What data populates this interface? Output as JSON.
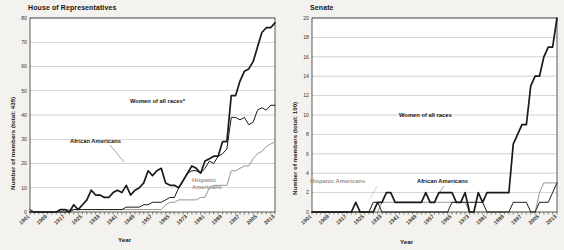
{
  "background": "#f4f2ee",
  "colors": {
    "women": "#1a1a1a",
    "african_americans": "#1a1a1a",
    "hispanic_americans": "#9a948a",
    "grid": "#8b857b",
    "axis": "#17140f",
    "text": "#17140f"
  },
  "chart_data": [
    {
      "type": "line",
      "title": "House of Representatives",
      "xlabel": "Year",
      "ylabel": "Number of members (total: 435)",
      "ylim": [
        0,
        80
      ],
      "ytick_step": 10,
      "yticks": [
        0,
        10,
        20,
        30,
        40,
        50,
        60,
        70,
        80
      ],
      "xlim": [
        1901,
        2013
      ],
      "xticks": [
        1901,
        1909,
        1917,
        1925,
        1933,
        1941,
        1949,
        1957,
        1965,
        1973,
        1981,
        1989,
        1997,
        2005,
        2013
      ],
      "xtick_labels": [
        "1901",
        "1909",
        "1917",
        "1925",
        "1933",
        "1941",
        "1949",
        "1957",
        "1965",
        "1973",
        "1981",
        "1989",
        "1997",
        "2005",
        "2013"
      ],
      "grid": true,
      "legend_position": "inline-annotations",
      "annotations": [
        {
          "text": "Women of all races*",
          "series": "women"
        },
        {
          "text": "African Americans",
          "series": "african_americans"
        },
        {
          "text": "Hispanic Americans",
          "series": "hispanic_americans"
        }
      ],
      "x": [
        1901,
        1903,
        1905,
        1907,
        1909,
        1911,
        1913,
        1915,
        1917,
        1919,
        1921,
        1923,
        1925,
        1927,
        1929,
        1931,
        1933,
        1935,
        1937,
        1939,
        1941,
        1943,
        1945,
        1947,
        1949,
        1951,
        1953,
        1955,
        1957,
        1959,
        1961,
        1963,
        1965,
        1967,
        1969,
        1971,
        1973,
        1975,
        1977,
        1979,
        1981,
        1983,
        1985,
        1987,
        1989,
        1991,
        1993,
        1995,
        1997,
        1999,
        2001,
        2003,
        2005,
        2007,
        2009,
        2011,
        2013
      ],
      "series": [
        {
          "name": "Women of all races*",
          "values": [
            0,
            0,
            0,
            0,
            0,
            0,
            0,
            1,
            1,
            0,
            3,
            1,
            3,
            5,
            9,
            7,
            7,
            6,
            6,
            8,
            9,
            8,
            11,
            7,
            9,
            10,
            12,
            17,
            15,
            17,
            18,
            12,
            11,
            11,
            10,
            13,
            16,
            19,
            18,
            16,
            21,
            22,
            23,
            23,
            29,
            29,
            48,
            48,
            54,
            58,
            59,
            62,
            68,
            74,
            76,
            76,
            78
          ]
        },
        {
          "name": "African Americans",
          "values": [
            1,
            0,
            0,
            0,
            0,
            0,
            0,
            0,
            0,
            0,
            1,
            1,
            1,
            1,
            1,
            1,
            1,
            1,
            1,
            1,
            1,
            1,
            2,
            2,
            2,
            2,
            3,
            3,
            4,
            4,
            4,
            5,
            6,
            6,
            10,
            13,
            16,
            17,
            17,
            16,
            18,
            21,
            20,
            23,
            24,
            26,
            39,
            39,
            38,
            39,
            36,
            37,
            42,
            43,
            42,
            44,
            44
          ]
        },
        {
          "name": "Hispanic Americans",
          "values": [
            0,
            0,
            0,
            0,
            0,
            0,
            0,
            0,
            1,
            1,
            1,
            1,
            1,
            1,
            1,
            1,
            1,
            1,
            1,
            1,
            1,
            1,
            1,
            1,
            1,
            1,
            1,
            1,
            1,
            1,
            1,
            3,
            4,
            4,
            5,
            5,
            5,
            5,
            5,
            6,
            6,
            10,
            11,
            11,
            11,
            11,
            17,
            17,
            18,
            19,
            19,
            22,
            24,
            25,
            27,
            28,
            29
          ]
        }
      ]
    },
    {
      "type": "line",
      "title": "Senate",
      "xlabel": "Year",
      "ylabel": "Number of members (total: 100)",
      "ylim": [
        0,
        20
      ],
      "ytick_step": 2,
      "yticks": [
        0,
        2,
        4,
        6,
        8,
        10,
        12,
        14,
        16,
        18,
        20
      ],
      "xlim": [
        1901,
        2013
      ],
      "xticks": [
        1901,
        1909,
        1917,
        1925,
        1933,
        1941,
        1949,
        1957,
        1965,
        1973,
        1981,
        1989,
        1997,
        2005,
        2013
      ],
      "xtick_labels": [
        "1901",
        "1909",
        "1917",
        "1925",
        "1933",
        "1941",
        "1949",
        "1957",
        "1965",
        "1973",
        "1981",
        "1989",
        "1997",
        "2005",
        "2013"
      ],
      "grid": true,
      "legend_position": "inline-annotations",
      "annotations": [
        {
          "text": "Women of all races",
          "series": "women"
        },
        {
          "text": "African Americans",
          "series": "african_americans"
        },
        {
          "text": "Hispanic Americans",
          "series": "hispanic_americans"
        }
      ],
      "x": [
        1901,
        1903,
        1905,
        1907,
        1909,
        1911,
        1913,
        1915,
        1917,
        1919,
        1921,
        1923,
        1925,
        1927,
        1929,
        1931,
        1933,
        1935,
        1937,
        1939,
        1941,
        1943,
        1945,
        1947,
        1949,
        1951,
        1953,
        1955,
        1957,
        1959,
        1961,
        1963,
        1965,
        1967,
        1969,
        1971,
        1973,
        1975,
        1977,
        1979,
        1981,
        1983,
        1985,
        1987,
        1989,
        1991,
        1993,
        1995,
        1997,
        1999,
        2001,
        2003,
        2005,
        2007,
        2009,
        2011,
        2013
      ],
      "series": [
        {
          "name": "Women of all races",
          "values": [
            0,
            0,
            0,
            0,
            0,
            0,
            0,
            0,
            0,
            0,
            1,
            0,
            0,
            0,
            0,
            1,
            1,
            2,
            2,
            1,
            1,
            1,
            1,
            1,
            1,
            1,
            2,
            1,
            1,
            2,
            2,
            2,
            2,
            1,
            1,
            2,
            0,
            0,
            2,
            1,
            2,
            2,
            2,
            2,
            2,
            2,
            7,
            8,
            9,
            9,
            13,
            14,
            14,
            16,
            17,
            17,
            20
          ]
        },
        {
          "name": "African Americans",
          "values": [
            0,
            0,
            0,
            0,
            0,
            0,
            0,
            0,
            0,
            0,
            0,
            0,
            0,
            0,
            1,
            1,
            0,
            0,
            0,
            0,
            0,
            0,
            0,
            0,
            0,
            0,
            0,
            0,
            0,
            0,
            0,
            0,
            1,
            1,
            1,
            1,
            1,
            1,
            1,
            1,
            0,
            0,
            0,
            0,
            0,
            0,
            1,
            1,
            1,
            1,
            0,
            0,
            1,
            1,
            1,
            2,
            3
          ]
        },
        {
          "name": "Hispanic Americans",
          "values": [
            0,
            0,
            0,
            0,
            0,
            0,
            0,
            0,
            0,
            0,
            0,
            0,
            0,
            0,
            0,
            0,
            1,
            1,
            1,
            1,
            1,
            1,
            1,
            1,
            1,
            1,
            1,
            1,
            1,
            1,
            1,
            1,
            1,
            1,
            1,
            1,
            0,
            0,
            0,
            0,
            0,
            0,
            0,
            0,
            0,
            0,
            0,
            0,
            0,
            0,
            0,
            0,
            2,
            3,
            3,
            3,
            3
          ]
        }
      ]
    }
  ]
}
